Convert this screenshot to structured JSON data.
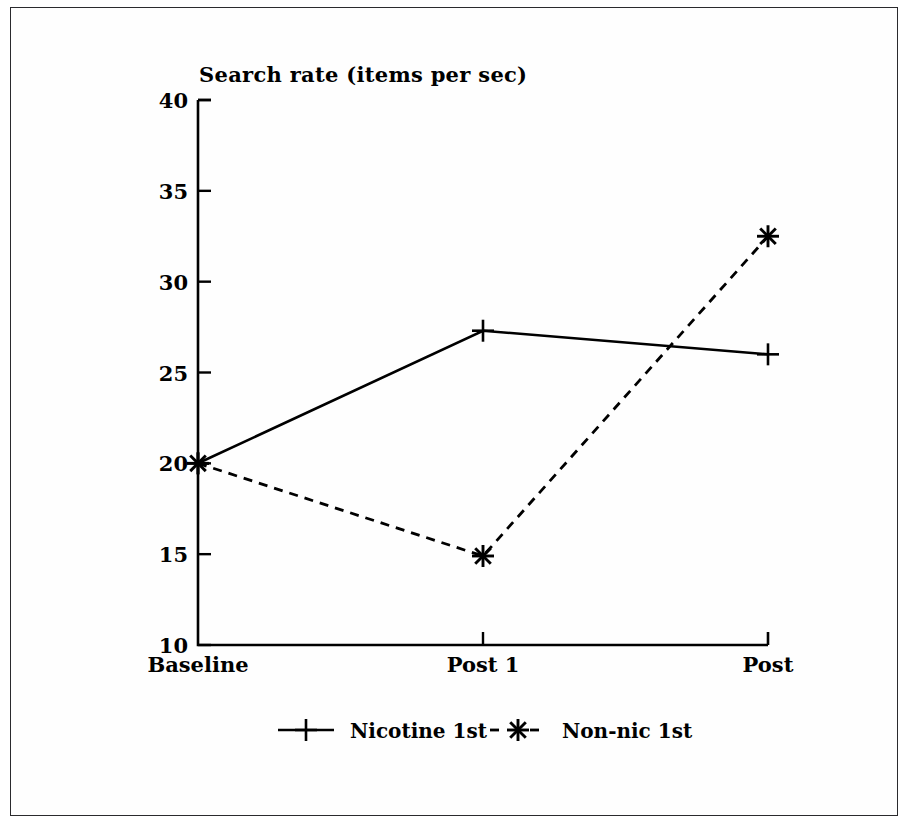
{
  "chart_data": {
    "type": "line",
    "title": "Search rate (items per sec)",
    "xlabel": "",
    "ylabel": "Search rate (items per sec)",
    "categories": [
      "Baseline",
      "Post 1",
      "Post"
    ],
    "ylim": [
      10,
      40
    ],
    "yticks": [
      10,
      15,
      20,
      25,
      30,
      35,
      40
    ],
    "ytick_labels": [
      "10",
      "15",
      "20",
      "25",
      "30",
      "35",
      "40"
    ],
    "grid": false,
    "legend_position": "bottom",
    "series": [
      {
        "name": "Nicotine 1st",
        "values": [
          20,
          27.3,
          26
        ],
        "linestyle": "solid",
        "marker": "plus",
        "color": "#000000"
      },
      {
        "name": "Non-nic 1st",
        "values": [
          20,
          14.9,
          32.5
        ],
        "linestyle": "dashed",
        "marker": "asterisk",
        "color": "#000000"
      }
    ]
  },
  "figure": {
    "background_color": "#ffffff",
    "border_color": "#2a2a2d",
    "ink_color": "#000000"
  },
  "legend": {
    "items": [
      {
        "label": "Nicotine 1st",
        "marker": "plus-marker",
        "linestyle": "solid"
      },
      {
        "label": "Non-nic 1st",
        "marker": "asterisk-marker",
        "linestyle": "dashed"
      }
    ]
  }
}
